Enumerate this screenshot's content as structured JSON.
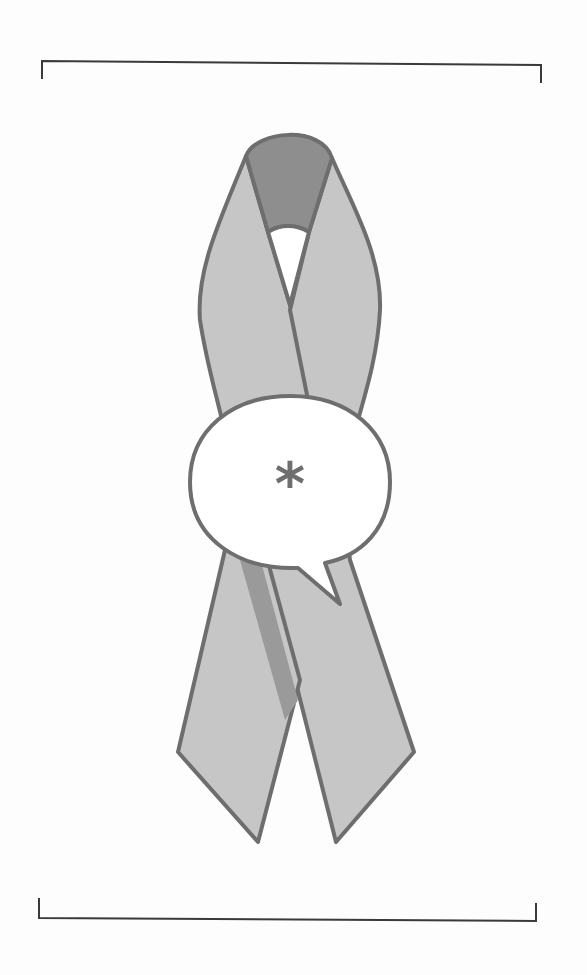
{
  "illustration": {
    "subject": "awareness-ribbon-with-speech-bubble",
    "bubble_text": "*",
    "colors": {
      "background": "#fdfdfd",
      "ribbon_fill": "#c6c6c6",
      "ribbon_loop_dark": "#8e8e8e",
      "ribbon_shadow": "#9a9a9a",
      "outline": "#6e6e6e",
      "bubble_fill": "#ffffff",
      "asterisk": "#6e6e6e",
      "crop_marks": "#3a3a3a"
    }
  }
}
